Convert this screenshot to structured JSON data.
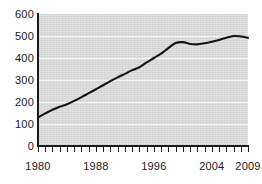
{
  "chart_data": {
    "type": "line",
    "title": "",
    "subtitle": "",
    "xlabel": "",
    "ylabel": "",
    "xlim": [
      1980,
      2009
    ],
    "ylim": [
      0,
      600
    ],
    "grid": true,
    "legend": null,
    "y_ticks": [
      0,
      100,
      200,
      300,
      400,
      500,
      600
    ],
    "y_tick_labels": [
      "0",
      "100",
      "200",
      "300",
      "400",
      "500",
      "600"
    ],
    "x_ticks": [
      1980,
      1981,
      1982,
      1983,
      1984,
      1985,
      1986,
      1987,
      1988,
      1989,
      1990,
      1991,
      1992,
      1993,
      1994,
      1995,
      1996,
      1997,
      1998,
      1999,
      2000,
      2001,
      2002,
      2003,
      2004,
      2005,
      2006,
      2007,
      2008,
      2009
    ],
    "x_tick_labels_shown": [
      "1980",
      "1988",
      "1996",
      "2004",
      "2009"
    ],
    "x_tick_labels_shown_at": [
      1980,
      1988,
      1996,
      2004,
      2009
    ],
    "series": [
      {
        "name": "series-1",
        "color": "#121212",
        "x": [
          1980,
          1981,
          1982,
          1983,
          1984,
          1985,
          1986,
          1987,
          1988,
          1989,
          1990,
          1991,
          1992,
          1993,
          1994,
          1995,
          1996,
          1997,
          1998,
          1999,
          2000,
          2001,
          2002,
          2003,
          2004,
          2005,
          2006,
          2007,
          2008,
          2009
        ],
        "values": [
          130,
          148,
          165,
          178,
          190,
          205,
          222,
          240,
          258,
          276,
          295,
          312,
          328,
          345,
          358,
          380,
          400,
          420,
          445,
          468,
          472,
          464,
          462,
          467,
          474,
          482,
          492,
          500,
          498,
          492
        ]
      }
    ],
    "plot_bg_color": "#dedede",
    "gridline_color": "#f3f3f3",
    "axis_color": "#1c1c1c",
    "page_bg_color": "#ffffff"
  }
}
